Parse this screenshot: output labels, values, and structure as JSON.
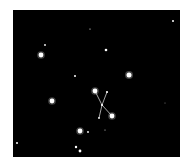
{
  "image": {
    "background": "#ffffff",
    "sky_color": "#000000",
    "star_color": "#ffffff",
    "line_color": "#cfcfcf"
  },
  "stars": [
    {
      "x": 41,
      "y": 55,
      "r": 2.4
    },
    {
      "x": 45,
      "y": 45,
      "r": 0.9
    },
    {
      "x": 52,
      "y": 101,
      "r": 2.4
    },
    {
      "x": 75,
      "y": 76,
      "r": 1.0
    },
    {
      "x": 106,
      "y": 50,
      "r": 1.3
    },
    {
      "x": 129,
      "y": 75,
      "r": 2.5
    },
    {
      "x": 173,
      "y": 21,
      "r": 1.0
    },
    {
      "x": 90,
      "y": 29,
      "r": 0.6
    },
    {
      "x": 80,
      "y": 131,
      "r": 2.4
    },
    {
      "x": 88,
      "y": 132,
      "r": 0.9
    },
    {
      "x": 76,
      "y": 147,
      "r": 1.2
    },
    {
      "x": 80,
      "y": 151,
      "r": 1.4
    },
    {
      "x": 17,
      "y": 143,
      "r": 1.0
    },
    {
      "x": 105,
      "y": 130,
      "r": 0.5
    },
    {
      "x": 165,
      "y": 103,
      "r": 0.4
    }
  ],
  "constellation": {
    "stars": [
      {
        "x": 95,
        "y": 91,
        "r": 2.4
      },
      {
        "x": 107,
        "y": 92,
        "r": 1.1
      },
      {
        "x": 102,
        "y": 105,
        "r": 1.1
      },
      {
        "x": 112,
        "y": 116,
        "r": 2.4
      },
      {
        "x": 99,
        "y": 118,
        "r": 0.9
      }
    ],
    "lines": [
      [
        0,
        2
      ],
      [
        1,
        2
      ],
      [
        2,
        3
      ],
      [
        2,
        4
      ]
    ]
  }
}
